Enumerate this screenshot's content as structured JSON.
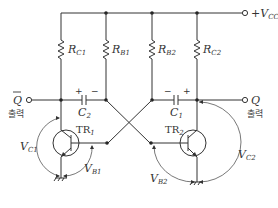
{
  "diagram": {
    "type": "astable multivibrator circuit",
    "supply": {
      "label": "+V",
      "sub": "CC"
    },
    "resistors": [
      {
        "id": "RC1",
        "label": "R",
        "sub": "C1"
      },
      {
        "id": "RB1",
        "label": "R",
        "sub": "B1"
      },
      {
        "id": "RB2",
        "label": "R",
        "sub": "B2"
      },
      {
        "id": "RC2",
        "label": "R",
        "sub": "C2"
      }
    ],
    "capacitors": [
      {
        "id": "C2",
        "label": "C",
        "sub": "2",
        "left_sign": "+",
        "right_sign": "−"
      },
      {
        "id": "C1",
        "label": "C",
        "sub": "1",
        "left_sign": "−",
        "right_sign": "+"
      }
    ],
    "transistors": [
      {
        "id": "TR1",
        "label": "TR",
        "sub": "1"
      },
      {
        "id": "TR2",
        "label": "TR",
        "sub": "2"
      }
    ],
    "outputs": [
      {
        "id": "Qbar",
        "label": "Q",
        "overbar": true,
        "caption": "출력"
      },
      {
        "id": "Q",
        "label": "Q",
        "overbar": false,
        "caption": "출력"
      }
    ],
    "voltages": [
      {
        "id": "VC1",
        "label": "V",
        "sub": "C1"
      },
      {
        "id": "VB1",
        "label": "V",
        "sub": "B1"
      },
      {
        "id": "VB2",
        "label": "V",
        "sub": "B2"
      },
      {
        "id": "VC2",
        "label": "V",
        "sub": "C2"
      }
    ]
  }
}
